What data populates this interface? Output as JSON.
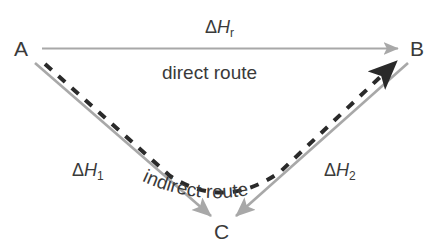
{
  "diagram": {
    "type": "hess-law-energy-cycle",
    "background_color": "#ffffff",
    "solid_arrow_color": "#a8a8a8",
    "dashed_arrow_color": "#2a2a2a",
    "text_color": "#3a3a3a",
    "nodes": [
      {
        "id": "A",
        "label": "A",
        "x": 22,
        "y": 48
      },
      {
        "id": "B",
        "label": "B",
        "x": 417,
        "y": 48
      },
      {
        "id": "C",
        "label": "C",
        "x": 222,
        "y": 231
      }
    ],
    "labels": {
      "delta_h_r": {
        "delta": "Δ",
        "symbol": "H",
        "subscript": "r"
      },
      "delta_h_1": {
        "delta": "Δ",
        "symbol": "H",
        "subscript": "1"
      },
      "delta_h_2": {
        "delta": "Δ",
        "symbol": "H",
        "subscript": "2"
      },
      "direct_route": "direct route",
      "indirect_route": "indirect route"
    },
    "arrows": [
      {
        "name": "direct-route-arrow",
        "from": "A",
        "to": "B",
        "style": "solid",
        "color": "#a8a8a8"
      },
      {
        "name": "delta-h1-arrow",
        "from": "A",
        "to": "C",
        "style": "solid",
        "color": "#a8a8a8"
      },
      {
        "name": "delta-h2-arrow",
        "from": "B",
        "to": "C",
        "style": "solid",
        "color": "#a8a8a8"
      },
      {
        "name": "indirect-route-arrow",
        "from": "A",
        "to": "B",
        "via": "C",
        "style": "dashed",
        "color": "#2a2a2a"
      }
    ]
  }
}
